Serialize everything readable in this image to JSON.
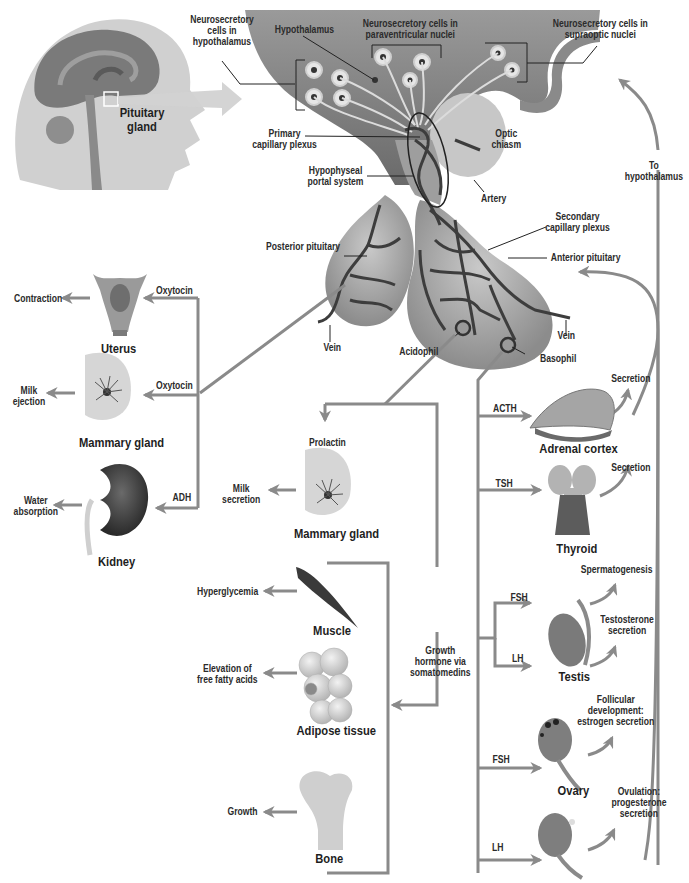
{
  "diagram": {
    "colors": {
      "arrow": "#8a8a8a",
      "tissue_dark": "#6f6f6f",
      "tissue_mid": "#9a9a9a",
      "tissue_light": "#c4c4c4",
      "head": "#cfcfcf",
      "vessel": "#3d3d3d",
      "text": "#2b2b2b"
    },
    "inset": {
      "label": "Pituitary\ngland"
    },
    "hypothalamus_labels": {
      "neurosecretory_hypothalamus": "Neurosecretory\ncells in\nhypothalamus",
      "hypothalamus": "Hypothalamus",
      "paraventricular": "Neurosecretory cells in\nparaventricular nuclei",
      "supraoptic": "Neurosecretory cells in\nsupraoptic nuclei",
      "primary_plexus": "Primary\ncapillary plexus",
      "portal_system": "Hypophyseal\nportal system",
      "optic_chiasm": "Optic\nchiasm",
      "artery": "Artery",
      "to_hypothalamus": "To\nhypothalamus"
    },
    "pituitary_labels": {
      "posterior": "Posterior pituitary",
      "secondary_plexus": "Secondary\ncapillary plexus",
      "anterior": "Anterior pituitary",
      "vein_left": "Vein",
      "vein_right": "Vein",
      "acidophil": "Acidophil",
      "basophil": "Basophil"
    },
    "posterior_targets": [
      {
        "organ": "Uterus",
        "hormone": "Oxytocin",
        "effect": "Contraction"
      },
      {
        "organ": "Mammary gland",
        "hormone": "Oxytocin",
        "effect": "Milk\nejection"
      },
      {
        "organ": "Kidney",
        "hormone": "ADH",
        "effect": "Water\nabsorption"
      }
    ],
    "acidophil_targets": {
      "prolactin": {
        "hormone": "Prolactin",
        "organ": "Mammary gland",
        "effect": "Milk\nsecretion"
      },
      "growth_hormone": {
        "hormone": "Growth\nhormone via\nsomatomedins",
        "targets": [
          {
            "organ": "Muscle",
            "effect": "Hyperglycemia"
          },
          {
            "organ": "Adipose tissue",
            "effect": "Elevation of\nfree fatty acids"
          },
          {
            "organ": "Bone",
            "effect": "Growth"
          }
        ]
      }
    },
    "basophil_targets": [
      {
        "organ": "Adrenal cortex",
        "hormone": "ACTH",
        "effect": "Secretion"
      },
      {
        "organ": "Thyroid",
        "hormone": "TSH",
        "effect": "Secretion"
      },
      {
        "organ": "Testis",
        "hormones": [
          "FSH",
          "LH"
        ],
        "effects": [
          "Spermatogenesis",
          "Testosterone\nsecretion"
        ]
      },
      {
        "organ": "Ovary",
        "hormones": [
          "FSH",
          "LH"
        ],
        "effects": [
          "Follicular\ndevelopment:\nestrogen secretion",
          "Ovulation:\nprogesterone\nsecretion"
        ]
      }
    ]
  }
}
